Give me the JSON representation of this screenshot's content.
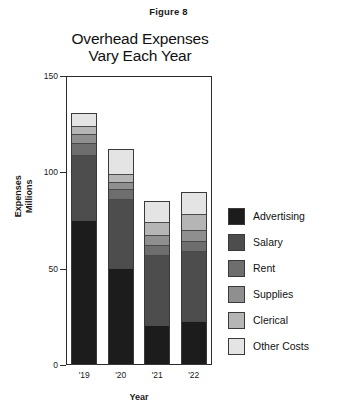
{
  "figure": {
    "caption": "Figure 8"
  },
  "chart_data": {
    "type": "bar",
    "subtype": "stacked-vertical",
    "title": "Overhead Expenses Vary Each Year",
    "title_line1": "Overhead Expenses",
    "title_line2": "Vary Each Year",
    "xlabel": "Year",
    "ylabel": "Expenses",
    "ylabel_sub": "Millions",
    "categories": [
      "'19",
      "'20",
      "'21",
      "'22"
    ],
    "ylim": [
      0,
      150
    ],
    "yticks": [
      0,
      50,
      100,
      150
    ],
    "ytick_labels": [
      "0",
      "50",
      "100",
      "150"
    ],
    "grid": false,
    "legend_position": "right",
    "stack_order_bottom_to_top": [
      "Advertising",
      "Salary",
      "Rent",
      "Supplies",
      "Clerical",
      "Other Costs"
    ],
    "series": [
      {
        "name": "Advertising",
        "color": "#1c1c1c",
        "values": [
          75,
          50,
          20,
          22
        ]
      },
      {
        "name": "Salary",
        "color": "#4d4d4d",
        "values": [
          34,
          36,
          37,
          37
        ]
      },
      {
        "name": "Rent",
        "color": "#6e6e6e",
        "values": [
          6,
          5,
          5,
          5
        ]
      },
      {
        "name": "Supplies",
        "color": "#8f8f8f",
        "values": [
          5,
          4,
          5,
          6
        ]
      },
      {
        "name": "Clerical",
        "color": "#b5b5b5",
        "values": [
          4,
          4,
          7,
          8
        ]
      },
      {
        "name": "Other Costs",
        "color": "#e4e4e4",
        "values": [
          7,
          13,
          11,
          12
        ]
      }
    ],
    "totals": [
      131,
      112,
      85,
      90
    ]
  },
  "legend": {
    "items": [
      {
        "label": "Advertising",
        "color": "#1c1c1c"
      },
      {
        "label": "Salary",
        "color": "#4d4d4d"
      },
      {
        "label": "Rent",
        "color": "#6e6e6e"
      },
      {
        "label": "Supplies",
        "color": "#8f8f8f"
      },
      {
        "label": "Clerical",
        "color": "#b5b5b5"
      },
      {
        "label": "Other Costs",
        "color": "#e4e4e4"
      }
    ]
  }
}
